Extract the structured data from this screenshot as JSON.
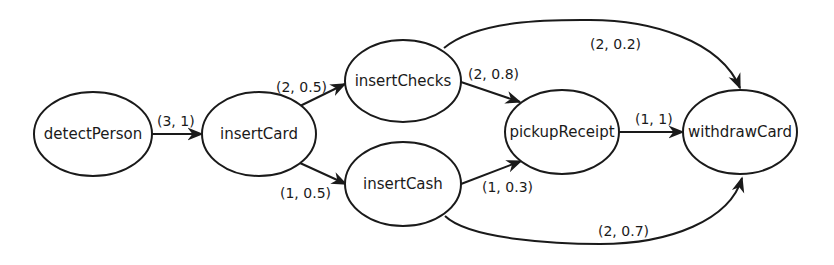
{
  "diagram": {
    "type": "state-transition-graph",
    "colors": {
      "stroke": "#1a1a1a",
      "background": "#ffffff"
    },
    "nodes": [
      {
        "id": "detectPerson",
        "label": "detectPerson"
      },
      {
        "id": "insertCard",
        "label": "insertCard"
      },
      {
        "id": "insertChecks",
        "label": "insertChecks"
      },
      {
        "id": "insertCash",
        "label": "insertCash"
      },
      {
        "id": "pickupReceipt",
        "label": "pickupReceipt"
      },
      {
        "id": "withdrawCard",
        "label": "withdrawCard"
      }
    ],
    "edges": [
      {
        "from": "detectPerson",
        "to": "insertCard",
        "label": "(3, 1)"
      },
      {
        "from": "insertCard",
        "to": "insertChecks",
        "label": "(2, 0.5)"
      },
      {
        "from": "insertCard",
        "to": "insertCash",
        "label": "(1, 0.5)"
      },
      {
        "from": "insertChecks",
        "to": "pickupReceipt",
        "label": "(2, 0.8)"
      },
      {
        "from": "insertChecks",
        "to": "withdrawCard",
        "label": "(2, 0.2)"
      },
      {
        "from": "insertCash",
        "to": "pickupReceipt",
        "label": "(1, 0.3)"
      },
      {
        "from": "insertCash",
        "to": "withdrawCard",
        "label": "(2, 0.7)"
      },
      {
        "from": "pickupReceipt",
        "to": "withdrawCard",
        "label": "(1, 1)"
      }
    ]
  }
}
